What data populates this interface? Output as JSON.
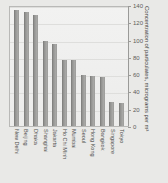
{
  "chart_data": {
    "type": "bar",
    "title": "",
    "xlabel": "",
    "ylabel": "Concentration of particulates, micrograms per m³",
    "ylim": [
      0,
      140
    ],
    "yticks": [
      0,
      20,
      40,
      60,
      80,
      100,
      120,
      140
    ],
    "grid": true,
    "legend": "none",
    "axis_position": "right",
    "categories": [
      "New Delhi",
      "Beijing",
      "Dhaka",
      "Shanghai",
      "Jakarta",
      "Ho Chi Minh",
      "Mumbai",
      "Seoul",
      "Hong Kong",
      "Bangkok",
      "Singapore",
      "Tokyo"
    ],
    "values": [
      135,
      133,
      130,
      99,
      96,
      78,
      77,
      60,
      59,
      58,
      29,
      28
    ],
    "bar_color": "#9c9c9a"
  },
  "colors": {
    "background": "#e9e9e7",
    "plot_background": "#f1f1f0",
    "bar": "#9c9c9a",
    "grid": "#dededc",
    "axis": "#9a9a98",
    "text": "#4d4d4b"
  }
}
